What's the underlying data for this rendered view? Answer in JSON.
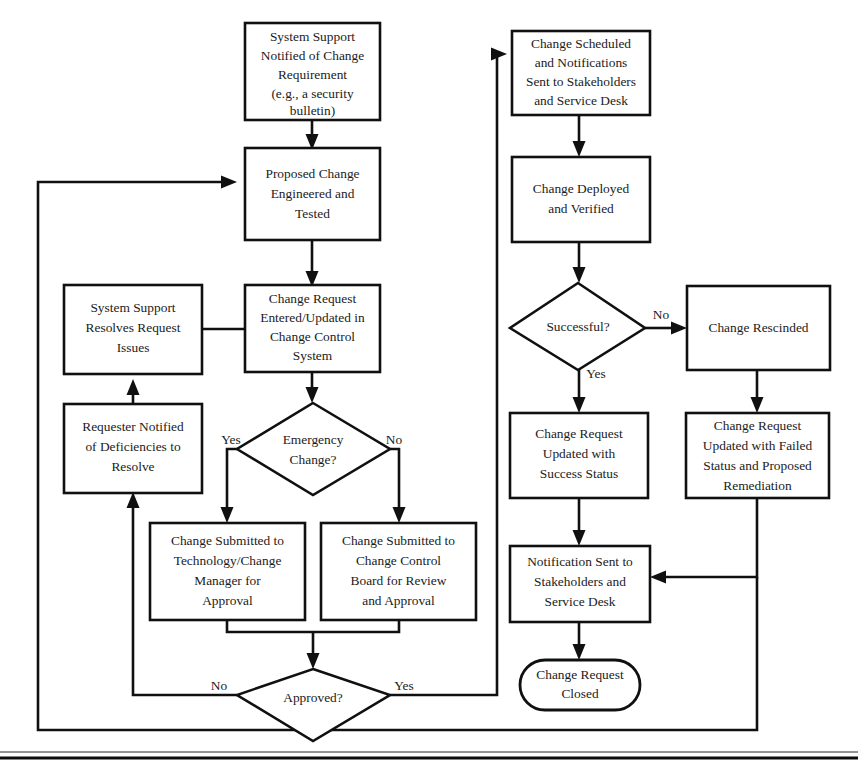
{
  "diagram": {
    "style": {
      "line_color": "#101010",
      "fill_color": "#ffffff",
      "text_color": "#1b1b1b"
    },
    "nodes": [
      {
        "id": "n1",
        "type": "process",
        "lines": [
          "System Support",
          "Notified of Change",
          "Requirement",
          "(e.g., a security",
          "bulletin)"
        ]
      },
      {
        "id": "n2",
        "type": "process",
        "lines": [
          "Proposed Change",
          "Engineered and",
          "Tested"
        ]
      },
      {
        "id": "n3",
        "type": "process",
        "lines": [
          "Change Request",
          "Entered/Updated in",
          "Change Control",
          "System"
        ]
      },
      {
        "id": "n4",
        "type": "decision",
        "lines": [
          "Emergency",
          "Change?"
        ]
      },
      {
        "id": "n5",
        "type": "process",
        "lines": [
          "System Support",
          "Resolves Request",
          "Issues"
        ]
      },
      {
        "id": "n6",
        "type": "process",
        "lines": [
          "Requester Notified",
          "of Deficiencies to",
          "Resolve"
        ]
      },
      {
        "id": "n7",
        "type": "process",
        "lines": [
          "Change Submitted to",
          "Technology/Change",
          "Manager for",
          "Approval"
        ]
      },
      {
        "id": "n8",
        "type": "process",
        "lines": [
          "Change Submitted to",
          "Change Control",
          "Board for Review",
          "and Approval"
        ]
      },
      {
        "id": "n9",
        "type": "decision",
        "lines": [
          "Approved?"
        ]
      },
      {
        "id": "n10",
        "type": "process",
        "lines": [
          "Change Scheduled",
          "and Notifications",
          "Sent to Stakeholders",
          "and Service Desk"
        ]
      },
      {
        "id": "n11",
        "type": "process",
        "lines": [
          "Change Deployed",
          "and Verified"
        ]
      },
      {
        "id": "n12",
        "type": "decision",
        "lines": [
          "Successful?"
        ]
      },
      {
        "id": "n13",
        "type": "process",
        "lines": [
          "Change Rescinded"
        ]
      },
      {
        "id": "n14",
        "type": "process",
        "lines": [
          "Change Request",
          "Updated with",
          "Success Status"
        ]
      },
      {
        "id": "n15",
        "type": "process",
        "lines": [
          "Change Request",
          "Updated with Failed",
          "Status and Proposed",
          "Remediation"
        ]
      },
      {
        "id": "n16",
        "type": "process",
        "lines": [
          "Notification Sent to",
          "Stakeholders and",
          "Service Desk"
        ]
      },
      {
        "id": "n17",
        "type": "terminator",
        "lines": [
          "Change Request",
          "Closed"
        ]
      }
    ],
    "edge_labels": {
      "emergency_yes": "Yes",
      "emergency_no": "No",
      "approved_no": "No",
      "approved_yes": "Yes",
      "successful_no": "No",
      "successful_yes": "Yes"
    }
  }
}
